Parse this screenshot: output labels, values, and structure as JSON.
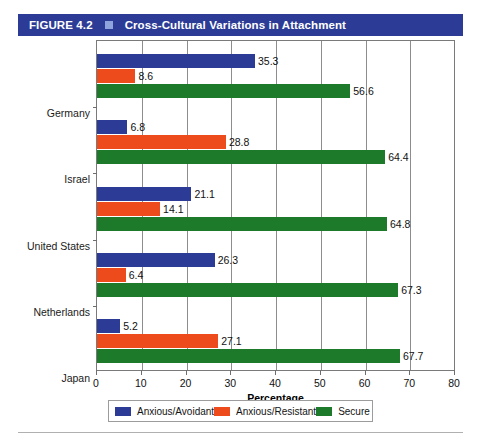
{
  "header": {
    "figure_number": "FIGURE 4.2",
    "separator_icon": "blue-square-icon",
    "title": "Cross-Cultural Variations in Attachment",
    "bar_color": "#2c3c96",
    "separator_color": "#8fa4dd"
  },
  "chart_data": {
    "type": "bar",
    "orientation": "horizontal",
    "title": "Cross-Cultural Variations in Attachment",
    "xlabel": "Percentage",
    "ylabel": "",
    "xlim": [
      0,
      80
    ],
    "xticks": [
      0,
      10,
      20,
      30,
      40,
      50,
      60,
      70,
      80
    ],
    "xtick_labels": [
      "0",
      "10",
      "20",
      "30",
      "40",
      "50",
      "60",
      "70",
      "80"
    ],
    "grid": true,
    "legend_position": "bottom",
    "categories": [
      "Germany",
      "Israel",
      "United States",
      "Netherlands",
      "Japan"
    ],
    "series": [
      {
        "name": "Anxious/Avoidant",
        "color": "#2c3c96",
        "values": [
          35.3,
          6.8,
          21.1,
          26.3,
          5.2
        ],
        "labels": [
          "35.3",
          "6.8",
          "21.1",
          "26.3",
          "5.2"
        ]
      },
      {
        "name": "Anxious/Resistant",
        "color": "#ee4b1c",
        "values": [
          8.6,
          28.8,
          14.1,
          6.4,
          27.1
        ],
        "labels": [
          "8.6",
          "28.8",
          "14.1",
          "6.4",
          "27.1"
        ]
      },
      {
        "name": "Secure",
        "color": "#1c7a2a",
        "values": [
          56.6,
          64.4,
          64.8,
          67.3,
          67.7
        ],
        "labels": [
          "56.6",
          "64.4",
          "64.8",
          "67.3",
          "67.7"
        ]
      }
    ]
  },
  "legend": {
    "items": [
      {
        "label": "Anxious/Avoidant",
        "color": "#2c3c96"
      },
      {
        "label": "Anxious/Resistant",
        "color": "#ee4b1c"
      },
      {
        "label": "Secure",
        "color": "#1c7a2a"
      }
    ]
  }
}
